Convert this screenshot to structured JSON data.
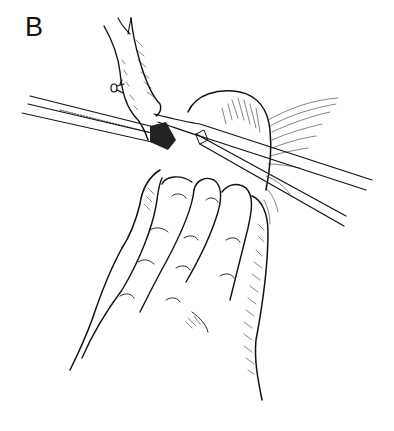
{
  "figure": {
    "panel_label": "B",
    "colors": {
      "ink": "#111111",
      "background": "#ffffff"
    },
    "elements": [
      "vessel",
      "tissue-mass",
      "hand",
      "forceps-left",
      "clamp-right",
      "ligature-knot",
      "fibrous-tissue"
    ]
  }
}
